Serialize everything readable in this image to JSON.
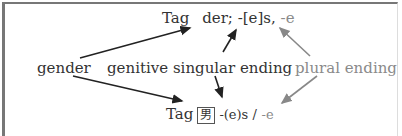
{
  "top_entry": {
    "headword": "Tag",
    "gender": "der;",
    "genitive": "-[e]s,",
    "plural": "-e"
  },
  "labels": {
    "gender": "gender",
    "genitive": "genitive singular ending",
    "plural": "plural ending"
  },
  "bottom_entry": {
    "headword": "Tag",
    "gender_symbol": "男",
    "genitive": "-(e)s /",
    "plural": "-e"
  },
  "colors": {
    "black_arrow": "#222222",
    "gray_arrow": "#888888",
    "gray_text": "#8a8a8a"
  }
}
